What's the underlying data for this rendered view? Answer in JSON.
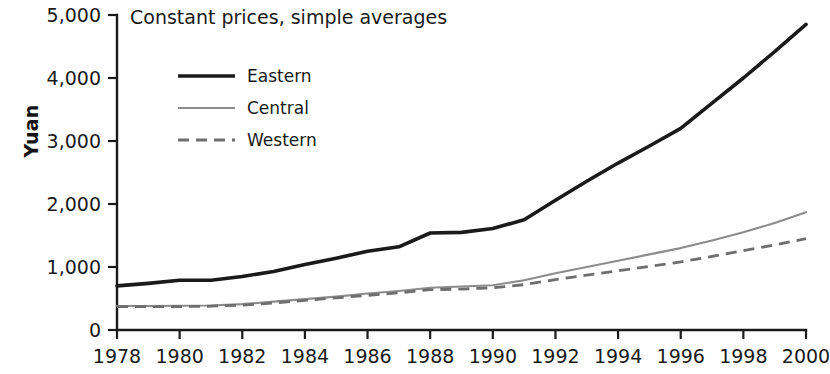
{
  "chart_data": {
    "type": "line",
    "title": "Constant prices, simple averages",
    "xlabel": "",
    "ylabel": "Yuan",
    "xlim": [
      1978,
      2000
    ],
    "ylim": [
      0,
      5000
    ],
    "grid": false,
    "legend_position": "top-left",
    "x": [
      1978,
      1979,
      1980,
      1981,
      1982,
      1983,
      1984,
      1985,
      1986,
      1987,
      1988,
      1989,
      1990,
      1991,
      1992,
      1993,
      1994,
      1995,
      1996,
      1997,
      1998,
      1999,
      2000
    ],
    "xticks": [
      "1978",
      "1980",
      "1982",
      "1984",
      "1986",
      "1988",
      "1990",
      "1992",
      "1994",
      "1996",
      "1998",
      "2000"
    ],
    "xtick_values": [
      1978,
      1980,
      1982,
      1984,
      1986,
      1988,
      1990,
      1992,
      1994,
      1996,
      1998,
      2000
    ],
    "yticks": [
      "0",
      "1,000",
      "2,000",
      "3,000",
      "4,000",
      "5,000"
    ],
    "ytick_values": [
      0,
      1000,
      2000,
      3000,
      4000,
      5000
    ],
    "series": [
      {
        "name": "Eastern",
        "style": "solid-thick",
        "color": "#1a1a1a",
        "values": [
          700,
          740,
          790,
          790,
          850,
          930,
          1040,
          1140,
          1250,
          1320,
          1540,
          1550,
          1610,
          1750,
          2060,
          2360,
          2650,
          2920,
          3200,
          3600,
          4000,
          4420,
          4850
        ]
      },
      {
        "name": "Central",
        "style": "solid-thin",
        "color": "#8c8c8c",
        "values": [
          380,
          380,
          385,
          390,
          410,
          450,
          490,
          530,
          580,
          620,
          670,
          690,
          710,
          790,
          900,
          1000,
          1100,
          1200,
          1300,
          1420,
          1550,
          1700,
          1870
        ]
      },
      {
        "name": "Western",
        "style": "dashed",
        "color": "#6e6e6e",
        "values": [
          370,
          370,
          372,
          378,
          395,
          430,
          470,
          510,
          550,
          590,
          640,
          650,
          670,
          720,
          800,
          870,
          940,
          1010,
          1080,
          1170,
          1260,
          1350,
          1450
        ]
      }
    ]
  },
  "legend": {
    "items": [
      {
        "label": "Eastern"
      },
      {
        "label": "Central"
      },
      {
        "label": "Western"
      }
    ]
  }
}
